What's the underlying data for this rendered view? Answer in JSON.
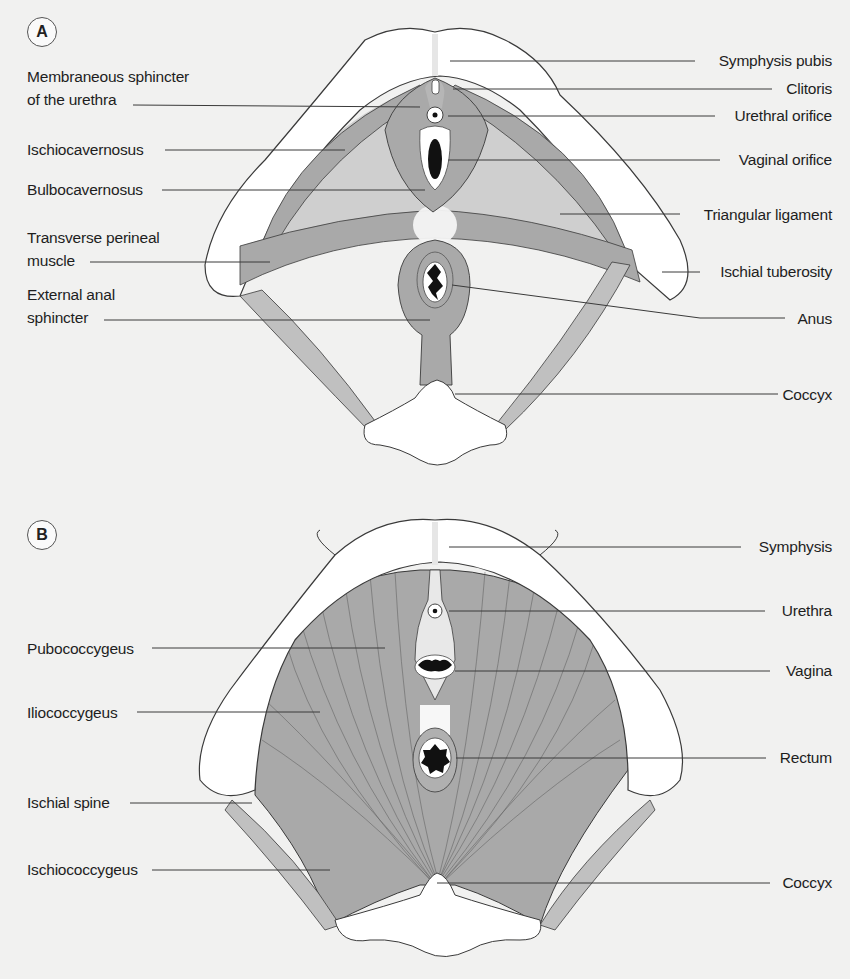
{
  "colors": {
    "background": "#f1f1f0",
    "bone": "#ffffff",
    "muscle": "#a9a9a9",
    "muscle_light": "#c9c9c9",
    "line": "#3a3a3a",
    "text": "#1e1e1e"
  },
  "panelA": {
    "badge": "A",
    "left_labels": [
      {
        "text": "Membraneous sphincter",
        "text2": "of the urethra"
      },
      {
        "text": "Ischiocavernosus"
      },
      {
        "text": "Bulbocavernosus"
      },
      {
        "text": "Transverse perineal",
        "text2": "muscle"
      },
      {
        "text": "External anal",
        "text2": "sphincter"
      }
    ],
    "right_labels": [
      {
        "text": "Symphysis pubis"
      },
      {
        "text": "Clitoris"
      },
      {
        "text": "Urethral orifice"
      },
      {
        "text": "Vaginal orifice"
      },
      {
        "text": "Triangular ligament"
      },
      {
        "text": "Ischial tuberosity"
      },
      {
        "text": "Anus"
      },
      {
        "text": "Coccyx"
      }
    ]
  },
  "panelB": {
    "badge": "B",
    "left_labels": [
      {
        "text": "Pubococcygeus"
      },
      {
        "text": "Iliococcygeus"
      },
      {
        "text": "Ischial spine"
      },
      {
        "text": "Ischiococcygeus"
      }
    ],
    "right_labels": [
      {
        "text": "Symphysis"
      },
      {
        "text": "Urethra"
      },
      {
        "text": "Vagina"
      },
      {
        "text": "Rectum"
      },
      {
        "text": "Coccyx"
      }
    ]
  }
}
